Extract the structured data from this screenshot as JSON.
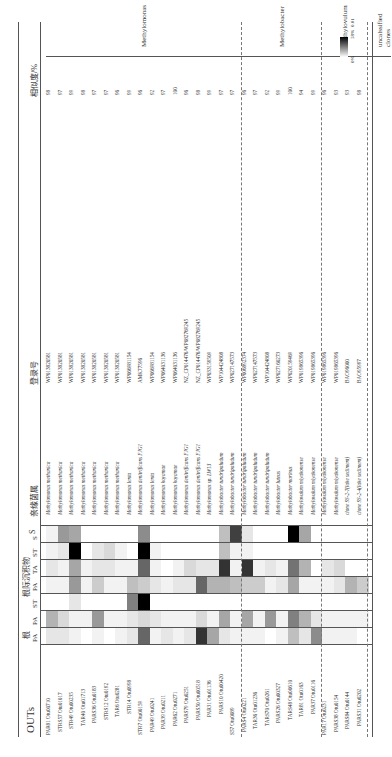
{
  "figure": {
    "headers": {
      "otus": "OUTs",
      "root": "根",
      "rhizo": "根际沉积物",
      "sediment": "S",
      "closest": "亲缘菌属",
      "accession": "登录号",
      "similarity": "相似度/%"
    },
    "sample_columns": [
      "PA",
      "PA",
      "ST",
      "PA",
      "TA",
      "ST",
      "S"
    ],
    "legend": {
      "max": "58%",
      "min": "0%"
    },
    "scale_bar": "0.01",
    "groups": [
      {
        "name": "Methylomonas",
        "rows": [
          0,
          16
        ]
      },
      {
        "name": "Methylobacter",
        "rows": [
          17,
          23
        ]
      },
      {
        "name": "Methylovulum",
        "rows": [
          24,
          27
        ]
      },
      {
        "name": "uncalssified clones",
        "rows": [
          28,
          29
        ]
      }
    ],
    "bootstrap": [
      "54",
      "64",
      "62",
      "54",
      "59",
      "72",
      "57",
      "90",
      "51",
      "62",
      "92"
    ]
  },
  "rows": [
    {
      "otu": "PAR81 Otu00710",
      "species": "Methylomonas methanica",
      "acc": "WP013820581",
      "sim": "98"
    },
    {
      "otu": "STRS57 Otu01017",
      "species": "Methylomonas methanica",
      "acc": "WP013820581",
      "sim": "97"
    },
    {
      "otu": "STR49 Otu00235",
      "species": "Methylomonas methanica",
      "acc": "WP013820581",
      "sim": "99"
    },
    {
      "otu": "TAR40 Otu01713",
      "species": "Methylomonas methanica",
      "acc": "WP013820581",
      "sim": "98"
    },
    {
      "otu": "PARS36 Otu0183",
      "species": "Methylomonas methanica",
      "acc": "WP013820581",
      "sim": "97"
    },
    {
      "otu": "STRS12 Otu0192",
      "species": "Methylomonas methanica",
      "acc": "WP013820581",
      "sim": "97"
    },
    {
      "otu": "TAR6 Otu0281",
      "species": "Methylomonas methanica",
      "acc": "WP013820581",
      "sim": "96"
    },
    {
      "otu": "STR14 Otu0998",
      "species": "Methylomonas lenta",
      "acc": "WP066981154",
      "sim": "99"
    },
    {
      "otu": "STR7 Otu00159",
      "species": "Methylomonas denitrificans FJG1",
      "acc": "AMK77596",
      "sim": "96"
    },
    {
      "otu": "PAR49 Otu0241",
      "species": "Methylomonas lenta",
      "acc": "WP066981154",
      "sim": "92"
    },
    {
      "otu": "PAR39 Otu0211",
      "species": "Methylomonas koyamae",
      "acc": "WP064031136",
      "sim": "97"
    },
    {
      "otu": "PAR62 Otu0271",
      "species": "Methylomonas koyamae",
      "acc": "WP064031136",
      "sim": "100"
    },
    {
      "otu": "PARS79 Otu0251",
      "species": "Methylomonas denitrificans FJG1",
      "acc": "NZ_CP014476/WP082769245",
      "sim": "96"
    },
    {
      "otu": "PARS50 Otu00518",
      "species": "Methylomonas denitrificans FJG1",
      "acc": "NZ_CP014476/WP082769245",
      "sim": "98"
    },
    {
      "otu": "PAR31 Otu01136",
      "species": "Methylomonas sp. LW13",
      "acc": "WP033159509",
      "sim": "99"
    },
    {
      "otu": "PARS10 Otu00420",
      "species": "Methylobacter tundripaludum",
      "acc": "WP104424808",
      "sim": "97"
    },
    {
      "otu": "S57 Otu0089",
      "species": "Methylobacter tundripaludum",
      "acc": "WP027147573",
      "sim": "97"
    },
    {
      "otu": "PARS4 Otu0221",
      "species": "Methylobacter tundripaludum",
      "acc": "WP006892374",
      "sim": "96"
    },
    {
      "otu": "TAR36 Otu01236",
      "species": "Methylobacter tundripaludum",
      "acc": "WP027147573",
      "sim": "97"
    },
    {
      "otu": "TARS70 Otu0261",
      "species": "Methylobacter tundripaludum",
      "acc": "WP104424808",
      "sim": "92"
    },
    {
      "otu": "PARS26 Otu00327",
      "species": "Methylobacter luteus",
      "acc": "WP027160273",
      "sim": "99"
    },
    {
      "otu": "TARS48 Otu00610",
      "species": "Methylobacter marinus",
      "acc": "WP020159469",
      "sim": "100"
    },
    {
      "otu": "TAR81 Otu0163",
      "species": "Methylovulum miyakonense",
      "acc": "WP019865396",
      "sim": "94"
    },
    {
      "otu": "PAR37 Otu0116",
      "species": "Methylovulum miyakonense",
      "acc": "WP019865396",
      "sim": "99"
    },
    {
      "otu": "PAR17 Otu0231",
      "species": "Methylovulum miyakonense",
      "acc": "WP019865396",
      "sim": "96"
    },
    {
      "otu": "PARS38 Otu0154",
      "species": "Methylovulum miyakonense",
      "acc": "WP019865396",
      "sim": "93"
    },
    {
      "otu": "PARS84 Otu0144",
      "species": "clone SS-2-7(lake sediment)",
      "acc": "BAO96000",
      "sim": "93"
    },
    {
      "otu": "PARS31 Otu0202",
      "species": "clone SS-2-4(lake sediment)",
      "acc": "BAO95997",
      "sim": "98"
    }
  ],
  "heatmap": [
    [
      0.1,
      0.3,
      0,
      0.05,
      0.1,
      0.05,
      0.05
    ],
    [
      0.1,
      0.15,
      0,
      0.05,
      0.05,
      0.1,
      0.4
    ],
    [
      0.05,
      0.05,
      0.1,
      0.4,
      0.35,
      1.0,
      0.35
    ],
    [
      0,
      0.05,
      0,
      0.05,
      0.05,
      0,
      0
    ],
    [
      0.05,
      0.4,
      0,
      0.2,
      0.1,
      0.1,
      0
    ],
    [
      0,
      0.05,
      0,
      0.05,
      0.1,
      0.15,
      0
    ],
    [
      0.05,
      0.05,
      0,
      0.05,
      0.05,
      0.05,
      0
    ],
    [
      0.1,
      0.1,
      0.5,
      0.25,
      0.05,
      0,
      0
    ],
    [
      0.6,
      0.15,
      1.0,
      0.2,
      0.6,
      1.0,
      0.45
    ],
    [
      0.05,
      0.1,
      0,
      0.1,
      0.05,
      0.05,
      0
    ],
    [
      0.1,
      0.05,
      0,
      0.05,
      0,
      0,
      0
    ],
    [
      0.05,
      0.05,
      0,
      0.1,
      0.05,
      0,
      0
    ],
    [
      0.1,
      0.05,
      0,
      0.1,
      0.15,
      0,
      0
    ],
    [
      0.8,
      0.15,
      0,
      0.6,
      0.1,
      0,
      0
    ],
    [
      0.35,
      0.05,
      0,
      0.3,
      0.1,
      0,
      0
    ],
    [
      0.1,
      0.35,
      0,
      0.3,
      0.8,
      0.25,
      0.25
    ],
    [
      0.05,
      0.05,
      0,
      0.25,
      0.05,
      0.05,
      0.75
    ],
    [
      0.05,
      0.35,
      0,
      0.2,
      0.8,
      0.05,
      0.1
    ],
    [
      0.05,
      0.05,
      0,
      0.2,
      0.05,
      0,
      0
    ],
    [
      0,
      0.4,
      0,
      0.05,
      0.1,
      0,
      0
    ],
    [
      0.05,
      0.05,
      0,
      0.1,
      0.05,
      0,
      0
    ],
    [
      0.25,
      0.5,
      0,
      0.35,
      0.55,
      0,
      1.0
    ],
    [
      0.1,
      0.3,
      0,
      0.05,
      0.3,
      0,
      0.35
    ],
    [
      0.45,
      0.1,
      0,
      0.05,
      0,
      0,
      0
    ],
    [
      0.05,
      0.05,
      0,
      0.05,
      0.1,
      0,
      0
    ],
    [
      0.05,
      0.05,
      0,
      0.1,
      0.15,
      0,
      0
    ],
    [
      0.05,
      0.05,
      0,
      0.3,
      0,
      0,
      0
    ],
    [
      0,
      0.05,
      0,
      0.2,
      0,
      0,
      0
    ]
  ]
}
